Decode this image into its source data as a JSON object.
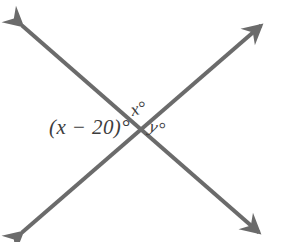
{
  "figure": {
    "type": "geometry-diagram",
    "background_color": "#ffffff",
    "line_color": "#6b6b6b",
    "text_color": "#3d3d3d",
    "line_width": 4,
    "canvas": {
      "width": 282,
      "height": 242
    },
    "intersection": {
      "x": 139,
      "y": 128
    },
    "lines": [
      {
        "name": "line-descending",
        "from": {
          "x": 18,
          "y": 22
        },
        "to": {
          "x": 263,
          "y": 236
        },
        "arrow_start": true,
        "arrow_end": true
      },
      {
        "name": "line-ascending",
        "from": {
          "x": 18,
          "y": 236
        },
        "to": {
          "x": 265,
          "y": 22
        },
        "arrow_start": true,
        "arrow_end": true
      }
    ],
    "labels": [
      {
        "id": "label-x-minus-20",
        "name": "angle-label-x-minus-20",
        "text": "(x − 20)°",
        "position": "left of intersection"
      },
      {
        "id": "label-x",
        "name": "angle-label-x",
        "text": "x°",
        "position": "above intersection"
      },
      {
        "id": "label-y",
        "name": "angle-label-y",
        "text": "y°",
        "position": "right of intersection"
      }
    ]
  }
}
